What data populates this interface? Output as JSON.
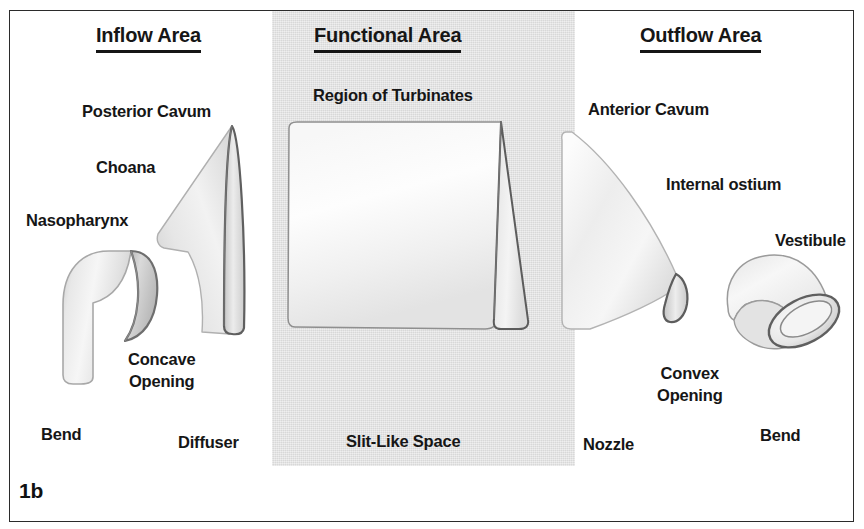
{
  "figure": {
    "number": "1b",
    "panel_bg": "#dcdcdc",
    "border_color": "#2b2b2b"
  },
  "sections": [
    {
      "key": "inflow",
      "heading": "Inflow Area"
    },
    {
      "key": "functional",
      "heading": "Functional Area"
    },
    {
      "key": "outflow",
      "heading": "Outflow Area"
    }
  ],
  "inflow": {
    "heading": "Inflow Area",
    "labels": {
      "posterior_cavum": "Posterior Cavum",
      "choana": "Choana",
      "nasopharynx": "Nasopharynx",
      "concave_opening_line1": "Concave",
      "concave_opening_line2": "Opening",
      "bend": "Bend",
      "diffuser": "Diffuser"
    }
  },
  "functional": {
    "heading": "Functional Area",
    "labels": {
      "region_of_turbinates": "Region of Turbinates",
      "slit_like_space": "Slit-Like Space"
    }
  },
  "outflow": {
    "heading": "Outflow Area",
    "labels": {
      "anterior_cavum": "Anterior Cavum",
      "internal_ostium": "Internal ostium",
      "vestibule": "Vestibule",
      "convex_opening_line1": "Convex",
      "convex_opening_line2": "Opening",
      "nozzle": "Nozzle",
      "bend": "Bend"
    }
  },
  "shapes": [
    {
      "name": "bend-elbow-left",
      "section": "inflow",
      "analogy": "Bend"
    },
    {
      "name": "diffuser-wedge",
      "section": "inflow",
      "analogy": "Diffuser"
    },
    {
      "name": "slit-like-slab",
      "section": "functional",
      "analogy": "Slit-Like Space"
    },
    {
      "name": "nozzle-wedge",
      "section": "outflow",
      "analogy": "Nozzle"
    },
    {
      "name": "bend-elbow-right",
      "section": "outflow",
      "analogy": "Bend"
    }
  ]
}
